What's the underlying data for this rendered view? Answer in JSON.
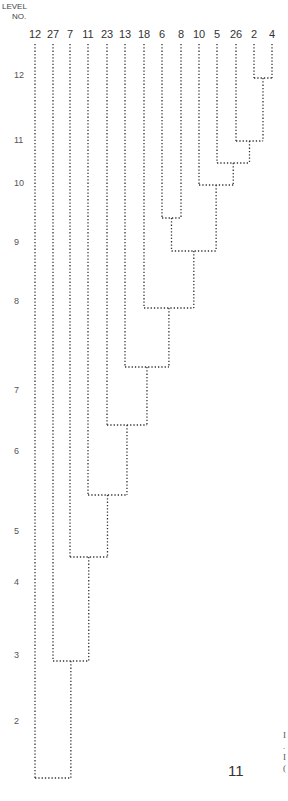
{
  "axis": {
    "title_line1": "LEVEL",
    "title_line2": "NO.",
    "levels": [
      {
        "label": "12",
        "y": 75
      },
      {
        "label": "11",
        "y": 140
      },
      {
        "label": "10",
        "y": 183
      },
      {
        "label": "9",
        "y": 242
      },
      {
        "label": "8",
        "y": 301
      },
      {
        "label": "7",
        "y": 390
      },
      {
        "label": "6",
        "y": 451
      },
      {
        "label": "5",
        "y": 531
      },
      {
        "label": "4",
        "y": 582
      },
      {
        "label": "3",
        "y": 655
      },
      {
        "label": "2",
        "y": 721
      }
    ]
  },
  "leaves": [
    {
      "label": "12",
      "x": 35
    },
    {
      "label": "27",
      "x": 53
    },
    {
      "label": "7",
      "x": 70
    },
    {
      "label": "11",
      "x": 88
    },
    {
      "label": "23",
      "x": 107
    },
    {
      "label": "13",
      "x": 125
    },
    {
      "label": "18",
      "x": 144
    },
    {
      "label": "6",
      "x": 162
    },
    {
      "label": "8",
      "x": 181
    },
    {
      "label": "10",
      "x": 199
    },
    {
      "label": "5",
      "x": 217
    },
    {
      "label": "26",
      "x": 236
    },
    {
      "label": "2",
      "x": 254
    },
    {
      "label": "4",
      "x": 272
    }
  ],
  "merges": [
    {
      "left": "2",
      "right": "4",
      "y": 78
    },
    {
      "left": "26",
      "right": "2-4",
      "y": 141
    },
    {
      "left": "5",
      "right": "26-2-4",
      "y": 163
    },
    {
      "left": "10",
      "right": "5-26-2-4",
      "y": 185
    },
    {
      "left": "6",
      "right": "8",
      "y": 218
    },
    {
      "left": "6-8",
      "right": "10-5-26-2-4",
      "y": 251
    },
    {
      "left": "18",
      "right": "cluster",
      "y": 308
    },
    {
      "left": "13",
      "right": "cluster",
      "y": 367
    },
    {
      "left": "23",
      "right": "cluster",
      "y": 425
    },
    {
      "left": "11",
      "right": "cluster",
      "y": 495
    },
    {
      "left": "7",
      "right": "cluster",
      "y": 557
    },
    {
      "left": "27",
      "right": "cluster",
      "y": 661
    },
    {
      "left": "12",
      "right": "cluster",
      "y": 778
    }
  ],
  "page_number": "11",
  "edge_text": [
    "I",
    ".",
    "I",
    "("
  ],
  "colors": {
    "line": "#333333",
    "text": "#333333"
  }
}
